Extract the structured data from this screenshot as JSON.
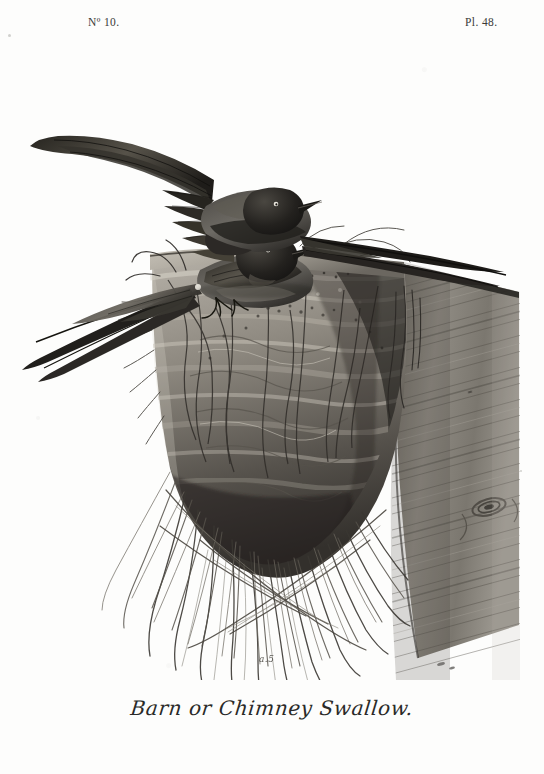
{
  "plate": {
    "header_left": "Nº 10.",
    "header_right": "Pl. 48.",
    "caption": "Barn or Chimney Swallow.",
    "inscription_mark": "a.5",
    "subject": "two-barn-swallows-on-mud-nest",
    "medium": "monochrome-engraving",
    "colors": {
      "paper": "#fdfdfb",
      "ink_dark": "#1b1b1a",
      "ink_mid": "#6d6b66",
      "ink_light": "#b9b7b1",
      "wood": "#8a867e",
      "nest": "#9a958c"
    },
    "elements": [
      {
        "name": "upper-swallow",
        "label": "Upper barn swallow with raised wing"
      },
      {
        "name": "lower-swallow",
        "label": "Lower barn swallow with forked tail"
      },
      {
        "name": "mud-nest",
        "label": "Mud pellet nest"
      },
      {
        "name": "straw-fringe",
        "label": "Hanging straw and grass strands"
      },
      {
        "name": "wooden-beam",
        "label": "Diagonal wooden beam with knot"
      }
    ]
  }
}
